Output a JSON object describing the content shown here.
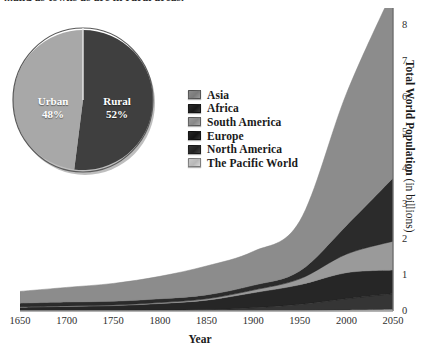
{
  "caption": {
    "partial_text": "...and as towns as are in rural areas."
  },
  "pie": {
    "name": "urban-rural-pie",
    "slices": [
      {
        "label": "Urban",
        "percent_text": "48%",
        "value": 48,
        "color": "#a8a8a8"
      },
      {
        "label": "Rural",
        "percent_text": "52%",
        "value": 52,
        "color": "#3f3f3f"
      }
    ]
  },
  "legend": {
    "items": [
      {
        "label": "Asia",
        "color": "#8c8c8c"
      },
      {
        "label": "Africa",
        "color": "#2b2b2b"
      },
      {
        "label": "South America",
        "color": "#9a9a9a"
      },
      {
        "label": "Europe",
        "color": "#262626"
      },
      {
        "label": "North America",
        "color": "#353535"
      },
      {
        "label": "The Pacific World",
        "color": "#c9c9c9"
      }
    ]
  },
  "axes": {
    "x_title": "Year",
    "y_title_bold": "Total World Population",
    "y_title_rest": " (in billions)",
    "x_ticks": [
      "1650",
      "1700",
      "1750",
      "1800",
      "1850",
      "1900",
      "1950",
      "2000",
      "2050"
    ],
    "y_ticks": [
      "0",
      "1",
      "2",
      "3",
      "4",
      "5",
      "6",
      "7",
      "8"
    ]
  },
  "chart_data": {
    "type": "area",
    "title": "",
    "subtitle": "",
    "xlabel": "Year",
    "ylabel": "Total World Population (in billions)",
    "xlim": [
      1650,
      2050
    ],
    "ylim": [
      0,
      8.5
    ],
    "grid": false,
    "legend_position": "inside-upper-left",
    "stacked": true,
    "x": [
      1650,
      1700,
      1750,
      1800,
      1850,
      1900,
      1950,
      2000,
      2050
    ],
    "series": [
      {
        "name": "The Pacific World",
        "color": "#c9c9c9",
        "values": [
          0.003,
          0.003,
          0.004,
          0.005,
          0.007,
          0.01,
          0.013,
          0.031,
          0.05
        ]
      },
      {
        "name": "North America",
        "color": "#353535",
        "values": [
          0.005,
          0.006,
          0.007,
          0.016,
          0.026,
          0.082,
          0.172,
          0.314,
          0.438
        ]
      },
      {
        "name": "Europe",
        "color": "#262626",
        "values": [
          0.1,
          0.12,
          0.14,
          0.19,
          0.27,
          0.42,
          0.55,
          0.73,
          0.66
        ]
      },
      {
        "name": "South America",
        "color": "#9a9a9a",
        "values": [
          0.012,
          0.013,
          0.016,
          0.024,
          0.038,
          0.074,
          0.167,
          0.52,
          0.81
        ]
      },
      {
        "name": "Africa",
        "color": "#2b2b2b",
        "values": [
          0.1,
          0.11,
          0.106,
          0.107,
          0.111,
          0.133,
          0.221,
          0.8,
          1.77
        ]
      },
      {
        "name": "Asia",
        "color": "#8c8c8c",
        "values": [
          0.33,
          0.41,
          0.5,
          0.63,
          0.81,
          0.95,
          1.4,
          3.7,
          5.27
        ]
      }
    ],
    "totals": [
      0.55,
      0.66,
      0.77,
      0.97,
      1.26,
      1.67,
      2.52,
      6.1,
      9.0
    ]
  }
}
